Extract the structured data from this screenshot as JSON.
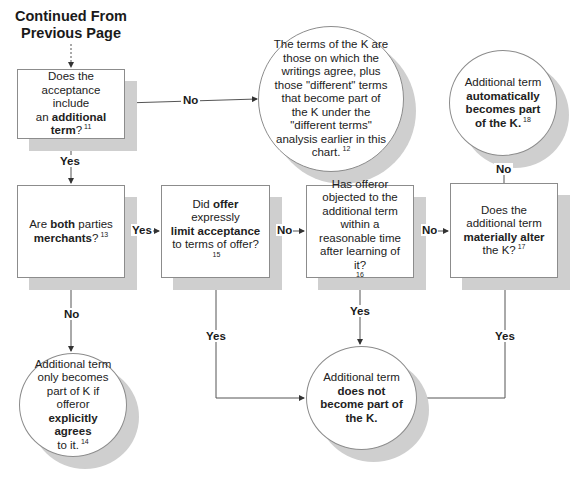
{
  "header": {
    "line1": "Continued From",
    "line2": "Previous Page"
  },
  "nodes": {
    "q_additional_term": {
      "parts": [
        "Does the",
        "acceptance include",
        "an ",
        "additional",
        "term",
        "?"
      ],
      "footnote": "11"
    },
    "r_terms_of_k": {
      "text": "The terms of the K are those on which the writings agree, plus those \"different\" terms that become part of the K under the \"different terms\" analysis earlier in this chart.",
      "footnote": "12"
    },
    "q_both_merchants": {
      "pre": "Are ",
      "bold1": "both",
      "mid": " parties",
      "bold2": "merchants",
      "post": "?",
      "footnote": "13"
    },
    "r_explicitly_agrees": {
      "pre": "Additional term only becomes part of K if offeror",
      "bold": "explicitly agrees",
      "post": "to it.",
      "footnote": "14"
    },
    "q_limit_acceptance": {
      "pre": "Did ",
      "bold1": "offer",
      "mid": " expressly",
      "bold2": "limit acceptance",
      "post": " to terms of offer?",
      "footnote": "15"
    },
    "q_offeror_objected": {
      "text": "Has offeror objected to the additional term within a reasonable time after learning of it?",
      "footnote": "16"
    },
    "q_materially_alter": {
      "pre": "Does the additional term ",
      "bold": "materially alter",
      "post": " the K?",
      "footnote": "17"
    },
    "r_automatically": {
      "pre": "Additional term",
      "bold": "automatically becomes part of the K.",
      "footnote": "18"
    },
    "r_does_not_become": {
      "pre": "Additional term",
      "bold": "does not become part of the K."
    }
  },
  "labels": {
    "no_box1": "No",
    "yes_box1": "Yes",
    "yes_box2": "Yes",
    "no_box2": "No",
    "no_box3": "No",
    "yes_box3": "Yes",
    "no_box4": "No",
    "yes_box4": "Yes",
    "no_box5": "No",
    "yes_box5": "Yes"
  },
  "colors": {
    "line": "#555555",
    "shadow": "#cfcfcf",
    "border": "#8c8c8c"
  }
}
